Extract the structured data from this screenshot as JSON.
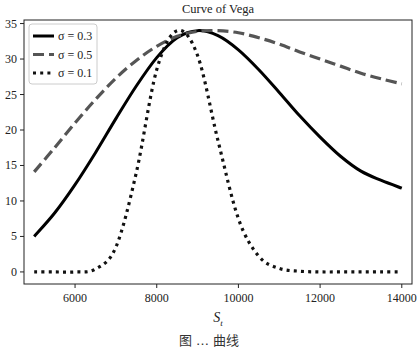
{
  "chart_data": {
    "type": "line",
    "title": "Curve of Vega",
    "xlabel": "S_t",
    "xlabel_main": "S",
    "xlabel_sub": "t",
    "ylabel": "",
    "xlim": [
      4750,
      14250
    ],
    "ylim": [
      -1.7,
      35.5
    ],
    "xticks": [
      6000,
      8000,
      10000,
      12000,
      14000
    ],
    "yticks": [
      0,
      5,
      10,
      15,
      20,
      25,
      30,
      35
    ],
    "grid": false,
    "legend_position": "upper left",
    "x": [
      5000,
      5500,
      6000,
      6500,
      7000,
      7500,
      8000,
      8500,
      9000,
      9500,
      10000,
      10500,
      11000,
      11500,
      12000,
      12500,
      13000,
      13500,
      14000
    ],
    "series": [
      {
        "name": "σ = 0.3",
        "style": "solid",
        "color": "#000000",
        "values": [
          5.0,
          8.3,
          12.3,
          16.8,
          21.6,
          26.2,
          30.2,
          33.0,
          34.0,
          33.3,
          31.3,
          28.5,
          25.3,
          22.0,
          19.0,
          16.3,
          14.2,
          12.9,
          11.8
        ]
      },
      {
        "name": "σ = 0.5",
        "style": "dashed",
        "color": "#555555",
        "values": [
          14.1,
          17.5,
          21.0,
          24.3,
          27.3,
          29.8,
          31.8,
          33.2,
          33.9,
          34.0,
          33.7,
          33.0,
          32.1,
          31.0,
          30.0,
          29.0,
          28.0,
          27.2,
          26.5
        ]
      },
      {
        "name": "σ = 0.1",
        "style": "dotted",
        "color": "#111111",
        "values": [
          0.0,
          0.0,
          0.0,
          0.4,
          3.5,
          14.0,
          28.5,
          34.0,
          30.5,
          18.5,
          7.5,
          2.2,
          0.5,
          0.1,
          0.0,
          0.0,
          0.0,
          0.0,
          0.0
        ]
      }
    ]
  },
  "caption": "图 … 曲线"
}
